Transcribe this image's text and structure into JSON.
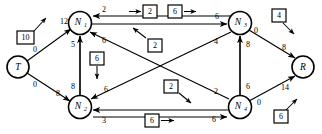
{
  "diagram": {
    "type": "directed-network-flow-graph",
    "canvas": {
      "width": 322,
      "height": 134
    },
    "colors": {
      "stroke": "#000000",
      "background": "#ffffff",
      "node_fill": "#ffffff"
    },
    "nodes": [
      {
        "id": "T",
        "label": "T",
        "sub": "",
        "cx": 18,
        "cy": 67,
        "r": 11
      },
      {
        "id": "N1",
        "label": "N",
        "sub": "1",
        "cx": 80,
        "cy": 23,
        "r": 11.5
      },
      {
        "id": "N2",
        "label": "N",
        "sub": "2",
        "cx": 80,
        "cy": 107,
        "r": 11.5
      },
      {
        "id": "N3",
        "label": "N",
        "sub": "3",
        "cx": 240,
        "cy": 23,
        "r": 11.5
      },
      {
        "id": "N4",
        "label": "N",
        "sub": "4",
        "cx": 240,
        "cy": 107,
        "r": 11.5
      },
      {
        "id": "R",
        "label": "R",
        "sub": "",
        "cx": 303,
        "cy": 67,
        "r": 11
      }
    ],
    "edges": [
      {
        "from": "T",
        "to": "N1",
        "label_near_target": "12",
        "label_near_source": "0",
        "x1": 27,
        "y1": 61,
        "x2": 71,
        "y2": 29,
        "lab_t_x": 38,
        "lab_t_y": 50,
        "lab_s_x": 61,
        "lab_s_y": 33
      },
      {
        "from": "T",
        "to": "N2",
        "label_near_target": "8",
        "label_near_source": "0",
        "x1": 27,
        "y1": 73,
        "x2": 70,
        "y2": 102,
        "lab_t_x": 38,
        "lab_t_y": 86,
        "lab_s_x": 60,
        "lab_s_y": 100
      },
      {
        "from": "N1",
        "to": "N2",
        "label_top": "5",
        "label_bottom": "8",
        "x1": 80,
        "y1": 34,
        "x2": 80,
        "y2": 96,
        "lab_t_x": 73,
        "lab_t_y": 44,
        "lab_s_x": 73,
        "lab_s_y": 86
      },
      {
        "from": "N3",
        "to": "N1",
        "label": "2",
        "x1": 229,
        "y1": 19,
        "x2": 92,
        "y2": 19,
        "lab_x": 105,
        "lab_y": 13
      },
      {
        "from": "N1",
        "to": "N3",
        "label": "6",
        "x1": 92,
        "y1": 26,
        "x2": 228,
        "y2": 26,
        "lab_x": 218,
        "lab_y": 19
      },
      {
        "from": "N4",
        "to": "N1",
        "label_target": "6",
        "label_source": "2",
        "x1": 229,
        "y1": 101,
        "x2": 89,
        "y2": 31,
        "lab_t_x": 104,
        "lab_t_y": 41,
        "lab_s_x": 215,
        "lab_s_y": 93
      },
      {
        "from": "N3",
        "to": "N2",
        "label_target": "6",
        "label_source": "4",
        "x1": 230,
        "y1": 31,
        "x2": 90,
        "y2": 100,
        "lab_t_x": 104,
        "lab_t_y": 90,
        "lab_s_x": 215,
        "lab_s_y": 42
      },
      {
        "from": "N4",
        "to": "N3",
        "label_top": "8",
        "label_bottom": "6",
        "x1": 240,
        "y1": 96,
        "x2": 240,
        "y2": 34,
        "lab_t_x": 248,
        "lab_t_y": 44,
        "lab_s_x": 248,
        "lab_s_y": 86
      },
      {
        "from": "N2",
        "to": "N4",
        "label_source": "3",
        "label_target": "6",
        "x1": 92,
        "y1": 112,
        "x2": 228,
        "y2": 112,
        "lab_s_x": 105,
        "lab_s_y": 119,
        "lab_t_x": 214,
        "lab_t_y": 118
      },
      {
        "from": "N3",
        "to": "R",
        "label_source": "0",
        "label_target": "8",
        "x1": 249,
        "y1": 30,
        "x2": 295,
        "y2": 58,
        "lab_s_x": 257,
        "lab_s_y": 33,
        "lab_t_x": 283,
        "lab_t_y": 50
      },
      {
        "from": "N4",
        "to": "R",
        "label_source": "0",
        "label_target": "14",
        "x1": 249,
        "y1": 101,
        "x2": 295,
        "y2": 74,
        "lab_s_x": 259,
        "lab_s_y": 101,
        "lab_t_x": 283,
        "lab_t_y": 87
      }
    ],
    "annotation_boxes": [
      {
        "id": "box-10",
        "value": "10",
        "bx": 17,
        "by": 31,
        "bw": 16,
        "bh": 13,
        "arrow": {
          "x1": 33,
          "y1": 31,
          "x2": 46,
          "y2": 17
        }
      },
      {
        "id": "box-2-top",
        "value": "2",
        "bx": 143,
        "by": 5,
        "bw": 14,
        "bh": 13,
        "arrow": {
          "x1": 129,
          "y1": 12,
          "x2": 142,
          "y2": 12
        }
      },
      {
        "id": "box-6-top",
        "value": "6",
        "bx": 168,
        "by": 5,
        "bw": 14,
        "bh": 13,
        "arrow": {
          "x1": 183,
          "y1": 12,
          "x2": 196,
          "y2": 12
        }
      },
      {
        "id": "box-4",
        "value": "4",
        "bx": 272,
        "by": 9,
        "bw": 14,
        "bh": 13,
        "arrow": {
          "x1": 283,
          "y1": 23,
          "x2": 293,
          "y2": 33
        }
      },
      {
        "id": "box-2-mid-upper",
        "value": "2",
        "bx": 148,
        "by": 39,
        "bw": 14,
        "bh": 13,
        "arrow": {
          "x1": 145,
          "y1": 38,
          "x2": 133,
          "y2": 29
        }
      },
      {
        "id": "box-6-left",
        "value": "6",
        "bx": 90,
        "by": 52,
        "bw": 14,
        "bh": 13,
        "arrow": {
          "x1": 97,
          "y1": 66,
          "x2": 97,
          "y2": 79
        }
      },
      {
        "id": "box-2-mid-lower",
        "value": "2",
        "bx": 164,
        "by": 80,
        "bw": 14,
        "bh": 13,
        "arrow": {
          "x1": 179,
          "y1": 93,
          "x2": 190,
          "y2": 102
        }
      },
      {
        "id": "box-6-bottom",
        "value": "6",
        "bx": 145,
        "by": 114,
        "bw": 14,
        "bh": 13,
        "arrow": {
          "x1": 161,
          "y1": 121,
          "x2": 174,
          "y2": 121
        }
      },
      {
        "id": "box-6-right",
        "value": "6",
        "bx": 274,
        "by": 110,
        "bw": 14,
        "bh": 13,
        "arrow": {
          "x1": 285,
          "y1": 110,
          "x2": 296,
          "y2": 100
        }
      }
    ]
  }
}
